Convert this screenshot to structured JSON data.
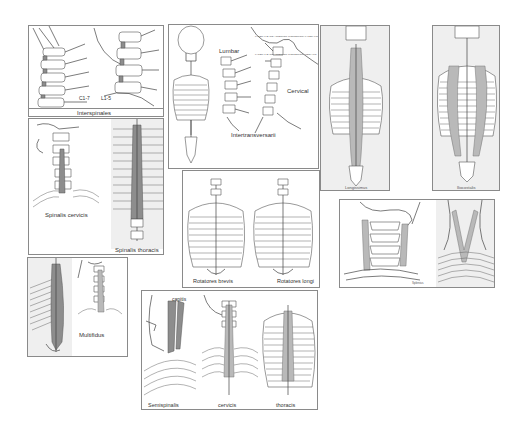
{
  "figure": {
    "panels": [
      {
        "id": "interspinales",
        "label": "Interspinales",
        "sublabels": [
          "C1-7",
          "L1-5"
        ]
      },
      {
        "id": "intertransversarii",
        "label": "Intertransversarii",
        "sublabels": [
          "Lumbar",
          "Cervical"
        ],
        "annotations": [
          "LATERAL BAND ANTERIOR (POSTERIOR) LATERALIS",
          "LATERAL BAND ANTERIOR (POSTERIOR) MEDIALIS"
        ]
      },
      {
        "id": "longissimus",
        "label": "Longissimus"
      },
      {
        "id": "iliocostalis",
        "label": "Iliocostalis"
      },
      {
        "id": "spinalis",
        "label": "",
        "sublabels": [
          "Spinalis cervicis",
          "Spinalis thoracis"
        ]
      },
      {
        "id": "rotatores",
        "label": "",
        "sublabels": [
          "Rotatores brevis",
          "Rotatores longi"
        ]
      },
      {
        "id": "splenius",
        "label": "Splenius"
      },
      {
        "id": "multifidus",
        "label": "Multifidus"
      },
      {
        "id": "semispinalis",
        "label": "",
        "sublabels": [
          "capitis",
          "Semispinalis",
          "cervicis",
          "thoracis"
        ]
      }
    ]
  },
  "colors": {
    "border": "#8a8a8a",
    "muscle": "#b9b9b9",
    "muscle_dark": "#8d8d8d",
    "line": "#444444",
    "background": "#ffffff"
  }
}
